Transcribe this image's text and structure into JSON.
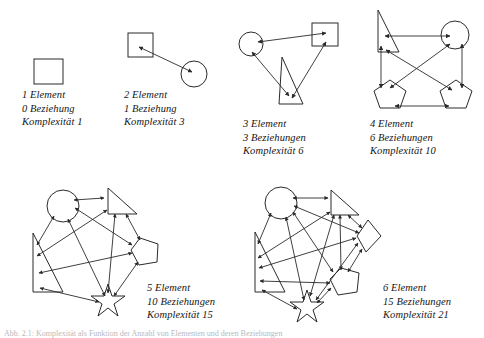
{
  "figure": {
    "stroke_color": "#2a2a2a",
    "background": "#ffffff"
  },
  "panels": [
    {
      "id": "panel-1",
      "elements": 1,
      "relations": 0,
      "complexity": 1,
      "shapes": [
        "square"
      ],
      "caption": {
        "line1": "1 Element",
        "line2": "0 Beziehung",
        "line3": "Komplexität 1"
      }
    },
    {
      "id": "panel-2",
      "elements": 2,
      "relations": 1,
      "complexity": 3,
      "shapes": [
        "square",
        "circle"
      ],
      "caption": {
        "line1": "2 Element",
        "line2": "1 Beziehung",
        "line3": "Komplexität 3"
      }
    },
    {
      "id": "panel-3",
      "elements": 3,
      "relations": 3,
      "complexity": 6,
      "shapes": [
        "circle",
        "square",
        "triangle"
      ],
      "caption": {
        "line1": "3 Element",
        "line2": "3 Beziehungen",
        "line3": "Komplexität 6"
      }
    },
    {
      "id": "panel-4",
      "elements": 4,
      "relations": 6,
      "complexity": 10,
      "shapes": [
        "triangle",
        "circle",
        "pentagon",
        "pentagon"
      ],
      "caption": {
        "line1": "4 Element",
        "line2": "6 Beziehungen",
        "line3": "Komplexität 10"
      }
    },
    {
      "id": "panel-5",
      "elements": 5,
      "relations": 10,
      "complexity": 15,
      "shapes": [
        "circle",
        "triangle",
        "pentagon",
        "star",
        "triangle"
      ],
      "caption": {
        "line1": "5 Element",
        "line2": "10 Beziehungen",
        "line3": "Komplexität 15"
      }
    },
    {
      "id": "panel-6",
      "elements": 6,
      "relations": 15,
      "complexity": 21,
      "shapes": [
        "circle",
        "triangle",
        "diamond",
        "pentagon",
        "star",
        "triangle"
      ],
      "caption": {
        "line1": "6 Element",
        "line2": "15 Beziehungen",
        "line3": "Komplexität 21"
      }
    }
  ],
  "footnote": {
    "text": "Abb. 2.1: Komplexität als Funktion der Anzahl von Elementen und deren Beziehungen"
  }
}
